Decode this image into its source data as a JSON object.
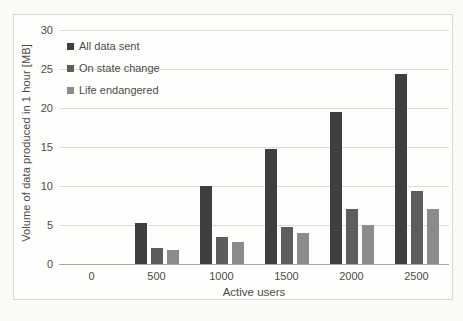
{
  "chart_data": {
    "type": "bar",
    "xlabel": "Active users",
    "ylabel": "Volume of data produced in 1 hour [MB]",
    "categories": [
      "0",
      "500",
      "1000",
      "1500",
      "2000",
      "2500"
    ],
    "series": [
      {
        "name": "All data sent",
        "color": "#3f3f3f",
        "values": [
          0,
          5.3,
          10.0,
          14.8,
          19.5,
          24.3
        ]
      },
      {
        "name": "On state change",
        "color": "#5d5d5d",
        "values": [
          0,
          2.1,
          3.4,
          4.8,
          7.0,
          9.3
        ]
      },
      {
        "name": "Life endangered",
        "color": "#8b8b8b",
        "values": [
          0,
          1.8,
          2.8,
          4.0,
          5.0,
          7.0
        ]
      }
    ],
    "ylim": [
      0,
      30
    ],
    "yticks": [
      0,
      5,
      10,
      15,
      20,
      25,
      30
    ],
    "grid": true,
    "legend_position": "top-left-inside",
    "colors": {
      "gridline": "#dcdbd6",
      "axis_line": "#a8a7a2",
      "text": "#4c4b49",
      "frame_border": "#d8d7d2",
      "frame_background": "#fefefc",
      "page_background": "#fbfaf6"
    }
  }
}
